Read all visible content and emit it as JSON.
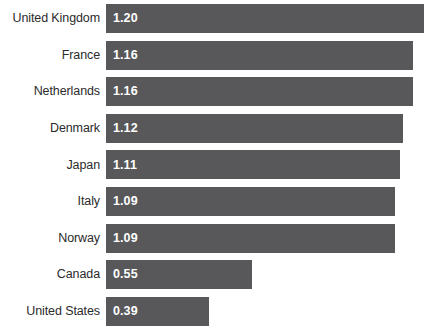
{
  "chart_data": {
    "type": "bar",
    "orientation": "horizontal",
    "title": "",
    "subtitle": "",
    "xlabel": "",
    "ylabel": "",
    "grid": false,
    "legend": null,
    "xlim": [
      0,
      1.2
    ],
    "axis_visible": false,
    "value_label_position": "inside-start",
    "categories": [
      "United Kingdom",
      "France",
      "Netherlands",
      "Denmark",
      "Japan",
      "Italy",
      "Norway",
      "Canada",
      "United States"
    ],
    "values": [
      1.2,
      1.16,
      1.16,
      1.12,
      1.11,
      1.09,
      1.09,
      0.55,
      0.39
    ],
    "value_labels": [
      "1.20",
      "1.16",
      "1.16",
      "1.12",
      "1.11",
      "1.09",
      "1.09",
      "0.55",
      "0.39"
    ],
    "colors": {
      "bar": "#58585a",
      "value_text": "#ffffff",
      "category_text": "#2b2b2b",
      "background": "#ffffff"
    }
  }
}
